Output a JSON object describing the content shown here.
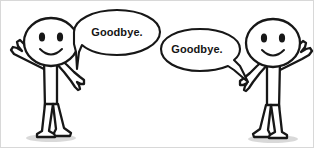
{
  "scene": {
    "title": "Goodbye stick figures illustration",
    "width": 314,
    "height": 148,
    "background_color": "#ffffff",
    "ink_color": "#171717",
    "fill_color": "#ffffff",
    "shadow_color": "#b9b9b9",
    "text_color": "#151515"
  },
  "speech_bubbles": [
    {
      "id": "left-bubble",
      "text": "Goodbye.",
      "tail_direction": "down-left",
      "speaker": "left-figure"
    },
    {
      "id": "right-bubble",
      "text": "Goodbye.",
      "tail_direction": "down-right",
      "speaker": "right-figure"
    }
  ],
  "figures": [
    {
      "id": "left-figure",
      "name": "left-stick-figure",
      "expression": "smiling",
      "pose": "waving-left-arm-raised",
      "facing": "right"
    },
    {
      "id": "right-figure",
      "name": "right-stick-figure",
      "expression": "smiling",
      "pose": "waving-right-arm-raised",
      "facing": "left"
    }
  ]
}
